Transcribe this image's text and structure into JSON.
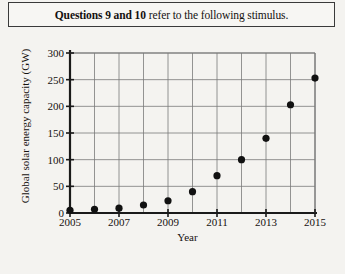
{
  "header": {
    "bold_part": "Questions 9 and 10",
    "rest_part": " refer to the following stimulus."
  },
  "chart_data": {
    "type": "scatter",
    "title": "",
    "xlabel": "Year",
    "ylabel": "Global solar energy capacity (GW)",
    "x": [
      2005,
      2006,
      2007,
      2008,
      2009,
      2010,
      2011,
      2012,
      2013,
      2014,
      2015
    ],
    "values": [
      5,
      7,
      9,
      15,
      23,
      40,
      70,
      100,
      140,
      203,
      253
    ],
    "xlim": [
      2005,
      2015
    ],
    "ylim": [
      0,
      300
    ],
    "xticks": [
      2005,
      2007,
      2009,
      2011,
      2013,
      2015
    ],
    "yticks": [
      0,
      50,
      100,
      150,
      200,
      250,
      300
    ],
    "xtick_labels": [
      "2005",
      "2007",
      "2009",
      "2011",
      "2013",
      "2015"
    ],
    "ytick_labels": [
      "0",
      "50",
      "100",
      "150",
      "200",
      "250",
      "300"
    ],
    "grid": true,
    "legend": null,
    "marker_color": "#111111",
    "grid_color": "#7a7a7a",
    "axis_color": "#1a1a1a"
  }
}
